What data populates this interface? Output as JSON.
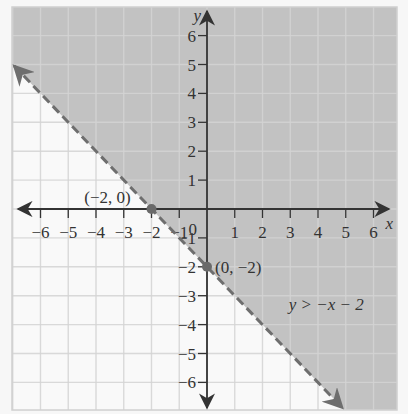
{
  "chart_data": {
    "type": "line",
    "title": "",
    "inequality": "y > −x − 2",
    "boundary_line": {
      "slope": -1,
      "intercept": -2,
      "style": "dashed"
    },
    "shaded_region": "above boundary line",
    "xlabel": "x",
    "ylabel": "y",
    "xlim": [
      -6.5,
      6.5
    ],
    "ylim": [
      -6.5,
      6.5
    ],
    "grid": true,
    "x_ticks": [
      -6,
      -5,
      -4,
      -3,
      -2,
      -1,
      1,
      2,
      3,
      4,
      5,
      6
    ],
    "y_ticks": [
      -6,
      -5,
      -4,
      -3,
      -2,
      -1,
      1,
      2,
      3,
      4,
      5,
      6
    ],
    "origin_label": "0",
    "points": [
      {
        "x": -2,
        "y": 0,
        "label": "(−2, 0)"
      },
      {
        "x": 0,
        "y": -2,
        "label": "(0, −2)"
      }
    ],
    "annotation": {
      "text": "y > −x − 2",
      "x": 4.3,
      "y": -3.5
    }
  },
  "colors": {
    "shade": "#c2c2c2",
    "grid_light": "#d4d4d4",
    "grid_shaded": "#b6b6b6",
    "background": "#f7f7f7",
    "axis": "#333333",
    "boundary": "#6e6e6e",
    "point": "#6a6a6a"
  }
}
